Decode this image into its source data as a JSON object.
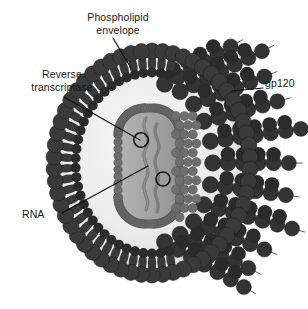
{
  "figure": {
    "background_color": "#ffffff"
  },
  "labels": {
    "phospholipid_envelope": "Phospholipid\nenvelope",
    "reverse_transcriptase": "Reverse\ntranscriptase",
    "gp120": "gp120",
    "rna": "RNA"
  },
  "colors": {
    "lipid_head": "#3a3a3a",
    "lipid_head_dark": "#2b2b2b",
    "spike_fill": "#333333",
    "capsid_bead": "#6e6e6e",
    "capsid_interior": "#a8a8a8",
    "matrix": "#ededed",
    "matrix_inner": "#e2e2e2",
    "rna_strand": "#7a7a7a",
    "leader_line": "#111111",
    "text": "#1a1a1a",
    "outline": "#1c1c1c"
  },
  "structures": [
    {
      "name": "phospholipid-envelope",
      "description": "bilayer of circular lipid heads with inward tails"
    },
    {
      "name": "gp120-spikes",
      "description": "radiating chains of dark beads on the right hemisphere"
    },
    {
      "name": "capsid-core",
      "description": "rounded-rectangle beaded capsid enclosing the genome"
    },
    {
      "name": "rna-strands",
      "description": "two wavy gray RNA strands inside the capsid"
    },
    {
      "name": "reverse-transcriptase-markers",
      "description": "two small open circles on the RNA strands"
    }
  ],
  "leader_lines": {
    "phospholipid": {
      "x1": 113,
      "y1": 38,
      "x2": 131,
      "y2": 68
    },
    "reverse_transcriptase": {
      "x1": 64,
      "y1": 97,
      "x2": 140,
      "y2": 140
    },
    "gp120": {
      "x1": 263,
      "y1": 88,
      "x2": 232,
      "y2": 91
    },
    "rna": {
      "x1": 62,
      "y1": 213,
      "x2": 148,
      "y2": 166
    }
  }
}
